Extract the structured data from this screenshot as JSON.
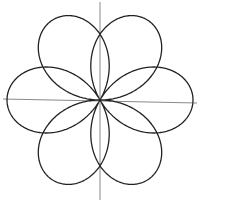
{
  "chart_data": {
    "type": "line",
    "subtype": "polar-rose",
    "title": "",
    "xlabel": "",
    "ylabel": "",
    "equation": "r = cos(3θ/2)",
    "theta_range": [
      0,
      12.566370614359172
    ],
    "petals": 6,
    "petal_tip_angles_deg": [
      0,
      60,
      120,
      180,
      240,
      300
    ],
    "r_max": 1,
    "grid": false,
    "legend": null,
    "ticks": false,
    "xlim": [
      -1.04,
      1.04
    ],
    "ylim": [
      -1.06,
      1.08
    ],
    "colors": {
      "curve": "#222222",
      "axes": "#8a8a8a",
      "background": "#ffffff"
    },
    "layout": {
      "origin_px": [
        100,
        100
      ],
      "scale_px_per_unit": 93,
      "x_axis_px": {
        "x1": 3,
        "y1": 99,
        "x2": 197,
        "y2": 103
      },
      "y_axis_px": {
        "x1": 100,
        "y1": 2,
        "x2": 100,
        "y2": 200
      }
    }
  }
}
